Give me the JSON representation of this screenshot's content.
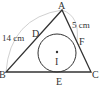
{
  "diagram": {
    "type": "geometry",
    "points": {
      "A": {
        "label": "A",
        "x": 62,
        "y": 10
      },
      "B": {
        "label": "B",
        "x": 6,
        "y": 72
      },
      "C": {
        "label": "C",
        "x": 91,
        "y": 72
      },
      "D": {
        "label": "D",
        "x": 38,
        "y": 38
      },
      "E": {
        "label": "E",
        "x": 60,
        "y": 72
      },
      "F": {
        "label": "F",
        "x": 77,
        "y": 41
      },
      "I": {
        "label": "I",
        "x": 57,
        "y": 53
      }
    },
    "incircle": {
      "cx": 57,
      "cy": 53,
      "r": 19
    },
    "measurements": {
      "AB": "14 cm",
      "AF": "5 cm"
    },
    "colors": {
      "line": "#333333",
      "arc": "#bbbbbb"
    }
  }
}
